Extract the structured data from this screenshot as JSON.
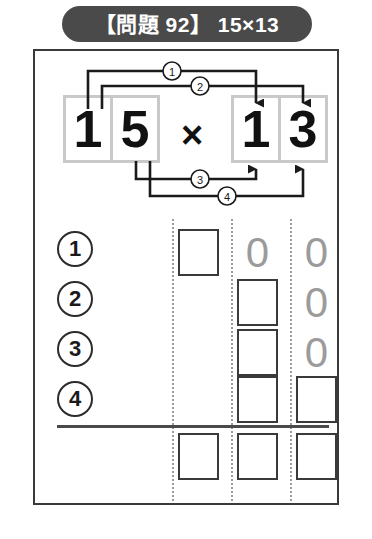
{
  "title": {
    "text": "【問題 92】 15×13",
    "problem_label": "問題",
    "problem_number": "92",
    "expression": "15×13",
    "background_color": "#4a4a4a",
    "text_color": "#ffffff"
  },
  "expression": {
    "multiplicand": "15",
    "multiplier": "13",
    "operator": "×",
    "left_digits": [
      "1",
      "5"
    ],
    "right_digits": [
      "1",
      "3"
    ],
    "digit_frame_color": "#c9c9c9"
  },
  "connectors": [
    {
      "label": "1",
      "from": "left-digit-1",
      "to": "right-digit-1",
      "direction": "down"
    },
    {
      "label": "2",
      "from": "left-digit-1",
      "to": "right-digit-3",
      "direction": "down"
    },
    {
      "label": "3",
      "from": "left-digit-5",
      "to": "right-digit-1",
      "direction": "up"
    },
    {
      "label": "4",
      "from": "left-digit-5",
      "to": "right-digit-3",
      "direction": "up"
    }
  ],
  "grid": {
    "row_markers": [
      "1",
      "2",
      "3",
      "4"
    ],
    "rows": [
      {
        "marker": "1",
        "cells": [
          {
            "type": "box"
          },
          {
            "type": "zero",
            "value": "0"
          },
          {
            "type": "zero",
            "value": "0"
          }
        ]
      },
      {
        "marker": "2",
        "cells": [
          {
            "type": "empty"
          },
          {
            "type": "box"
          },
          {
            "type": "zero",
            "value": "0"
          }
        ]
      },
      {
        "marker": "3",
        "cells": [
          {
            "type": "empty"
          },
          {
            "type": "box"
          },
          {
            "type": "zero",
            "value": "0"
          }
        ]
      },
      {
        "marker": "4",
        "cells": [
          {
            "type": "empty"
          },
          {
            "type": "box"
          },
          {
            "type": "box"
          }
        ]
      }
    ],
    "sum_row": {
      "cells": [
        {
          "type": "box"
        },
        {
          "type": "box"
        },
        {
          "type": "box"
        }
      ]
    },
    "ghost_zero_color": "#9b9b9b",
    "box_border_color": "#3a3a3a",
    "column_divider_color": "#9b9b9b"
  }
}
